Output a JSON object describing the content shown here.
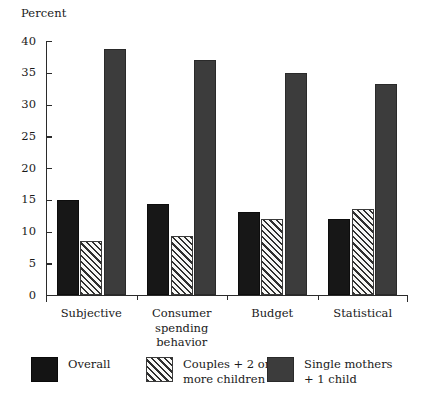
{
  "chart_data": {
    "type": "bar",
    "title": "",
    "subtitle": "",
    "xlabel": "",
    "ylabel": "Percent",
    "ylim": [
      0,
      40
    ],
    "yticks": [
      0,
      5,
      10,
      15,
      20,
      25,
      30,
      35,
      40
    ],
    "ytick_labels": [
      "0",
      "5",
      "10",
      "15",
      "20",
      "25",
      "30",
      "35",
      "40"
    ],
    "grid": false,
    "legend_position": "bottom",
    "categories": [
      "Subjective",
      "Consumer\nspending\nbehavior",
      "Budget",
      "Statistical"
    ],
    "category_labels_flat": [
      "Subjective",
      "Consumer spending behavior",
      "Budget",
      "Statistical"
    ],
    "series": [
      {
        "name": "Overall",
        "fill": "solid-black",
        "color": "#171717",
        "values": [
          15.0,
          14.3,
          13.0,
          12.0
        ]
      },
      {
        "name": "Couples + 2 or\nmore children",
        "fill": "diagonal-hatch",
        "color": "#f2f2f0",
        "values": [
          8.5,
          9.3,
          11.9,
          13.5
        ]
      },
      {
        "name": "Single mothers\n+ 1 child",
        "fill": "solid-gray",
        "color": "#3c3c3c",
        "values": [
          38.7,
          37.0,
          35.0,
          33.3
        ]
      }
    ]
  },
  "legend": {
    "items": [
      {
        "label": "Overall"
      },
      {
        "label": "Couples + 2 or\nmore children"
      },
      {
        "label": "Single mothers\n+ 1 child"
      }
    ]
  },
  "axes": {
    "y_axis_label": "Percent"
  }
}
